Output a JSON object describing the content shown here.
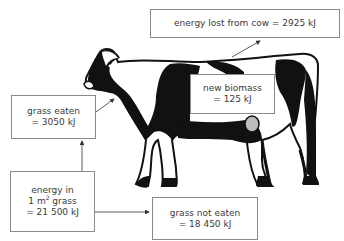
{
  "diagram": {
    "boxes": {
      "energy_lost": {
        "label": "energy lost from cow = 2925 kJ"
      },
      "new_biomass": {
        "line1": "new biomass",
        "line2": "= 125 kJ"
      },
      "grass_eaten": {
        "line1": "grass eaten",
        "line2": "= 3050 kJ"
      },
      "energy_in": {
        "line1": "energy in",
        "line2_prefix": "1 m",
        "line2_sup": "2",
        "line2_suffix": " grass",
        "line3": "= 21 500 kJ"
      },
      "grass_not_eaten": {
        "line1": "grass not eaten",
        "line2": "= 18 450 kJ"
      }
    },
    "arrows": [
      {
        "from": "energy_in",
        "to": "grass_eaten"
      },
      {
        "from": "energy_in",
        "to": "grass_not_eaten"
      },
      {
        "from": "grass_eaten",
        "to": "cow"
      },
      {
        "from": "cow",
        "to": "energy_lost"
      }
    ],
    "illustration": "holstein-cow",
    "colors": {
      "ink": "#111111",
      "border": "#8a8a8a",
      "text": "#3a3a3a",
      "udder": "#bdbdbd"
    }
  }
}
